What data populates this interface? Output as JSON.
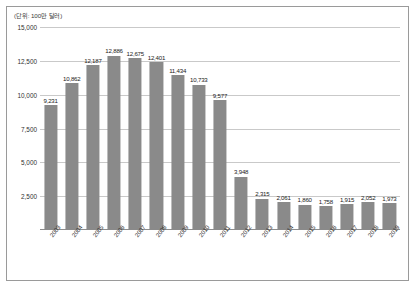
{
  "chart_data": {
    "type": "bar",
    "title": "",
    "subtitle": "",
    "unit_label": "(단위: 100만 달러)",
    "xlabel": "",
    "ylabel": "",
    "ylim": [
      0,
      15000
    ],
    "yticks": [
      "2,500",
      "5,000",
      "7,500",
      "10,000",
      "12,500",
      "15,000"
    ],
    "ytick_values": [
      2500,
      5000,
      7500,
      10000,
      12500,
      15000
    ],
    "grid": true,
    "legend": "none",
    "categories": [
      "2003",
      "2004",
      "2005",
      "2006",
      "2007",
      "2008",
      "2009",
      "2010",
      "2011",
      "2012",
      "2013",
      "2014",
      "2015",
      "2016",
      "2017",
      "2018",
      "2019"
    ],
    "values": [
      9231,
      10862,
      12187,
      12886,
      12675,
      12401,
      11434,
      10733,
      9577,
      3948,
      2315,
      2061,
      1860,
      1758,
      1915,
      2052,
      1973
    ],
    "value_labels": [
      "9,231",
      "10,862",
      "12,187",
      "12,886",
      "12,675",
      "12,401",
      "11,434",
      "10,733",
      "9,577",
      "3,948",
      "2,315",
      "2,061",
      "1,860",
      "1,758",
      "1,915",
      "2,052",
      "1,973"
    ],
    "series": [
      {
        "name": "",
        "values": [
          9231,
          10862,
          12187,
          12886,
          12675,
          12401,
          11434,
          10733,
          9577,
          3948,
          2315,
          2061,
          1860,
          1758,
          1915,
          2052,
          1973
        ]
      }
    ],
    "colors": {
      "bar": "#8a8a8a",
      "gridline": "#c9c9c9",
      "axis": "#8d8d8d",
      "frame": "#9a9a9a",
      "text": "#2f2f2f",
      "background": "#ffffff"
    }
  }
}
